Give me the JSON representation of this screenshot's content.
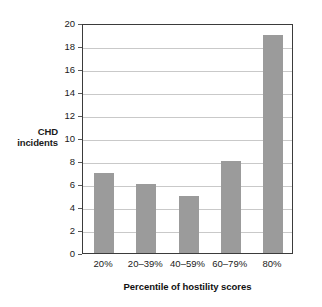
{
  "chart_data": {
    "type": "bar",
    "title": "",
    "subtitle": "",
    "xlabel": "Percentile of hostility scores",
    "ylabel": "CHD incidents",
    "ylabel_lines": [
      "CHD",
      "incidents"
    ],
    "categories": [
      "20%",
      "20–39%",
      "40–59%",
      "60–79%",
      "80%"
    ],
    "values": [
      7,
      6,
      5,
      8,
      19
    ],
    "series": [
      {
        "name": "CHD incidents",
        "values": [
          7,
          6,
          5,
          8,
          19
        ]
      }
    ],
    "ylim": [
      0,
      20
    ],
    "ytick_labels": [
      "0",
      "2",
      "4",
      "6",
      "8",
      "10",
      "12",
      "14",
      "16",
      "18",
      "20"
    ],
    "ytick_values": [
      0,
      2,
      4,
      6,
      8,
      10,
      12,
      14,
      16,
      18,
      20
    ],
    "ytick_step": 2,
    "xtick_labels": [
      "20%",
      "20–39%",
      "40–59%",
      "60–79%",
      "80%"
    ],
    "grid": "horizontal",
    "legend": "none",
    "legend_position": "none",
    "annotations": [],
    "colors": {
      "bar": "#9b9b9b",
      "gridline": "#c9c9c9",
      "axis_frame": "#3b3b3b",
      "background": "#ffffff",
      "text": "#1a1a1a"
    }
  }
}
